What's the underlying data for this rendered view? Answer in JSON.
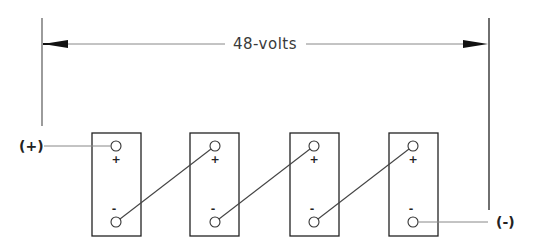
{
  "diagram": {
    "dimension": {
      "label": "48-volts",
      "left_x": 42,
      "right_x": 489,
      "y": 44
    },
    "terminals": {
      "positive_label": "(+)",
      "negative_label": "(-)"
    },
    "batteries": [
      {
        "id": "battery-1",
        "x": 92,
        "plus": "+",
        "minus": "-"
      },
      {
        "id": "battery-2",
        "x": 190,
        "plus": "+",
        "minus": "-"
      },
      {
        "id": "battery-3",
        "x": 290,
        "plus": "+",
        "minus": "-"
      },
      {
        "id": "battery-4",
        "x": 389,
        "plus": "+",
        "minus": "-"
      }
    ],
    "colors": {
      "line": "#555555",
      "box": "#222222",
      "arrow": "#111111"
    }
  }
}
